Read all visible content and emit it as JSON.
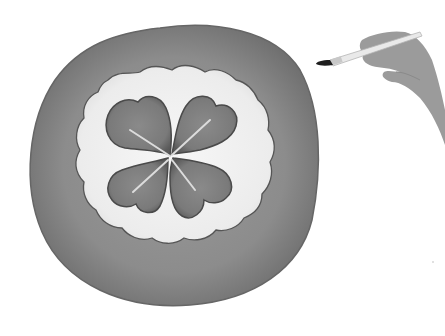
{
  "illustration": {
    "subject": "four-leaf clover watercolor inside wavy circle",
    "style": "grayscale watercolor",
    "colors": {
      "background": "#ffffff",
      "outer_ring": "#8a8a8a",
      "outer_ring_edge": "#6a6a6a",
      "inner_field": "#efefef",
      "clover": "#7a7a7a",
      "clover_edge": "#4e4e4e",
      "clover_veins": "#d8d8d8",
      "hand": "#9a9a9a",
      "brush_handle": "#e8e8e8",
      "brush_tip": "#1e1e1e"
    },
    "elements": [
      "outer-ring",
      "wavy-inner-field",
      "four-leaf-clover",
      "hand-with-paintbrush"
    ]
  }
}
